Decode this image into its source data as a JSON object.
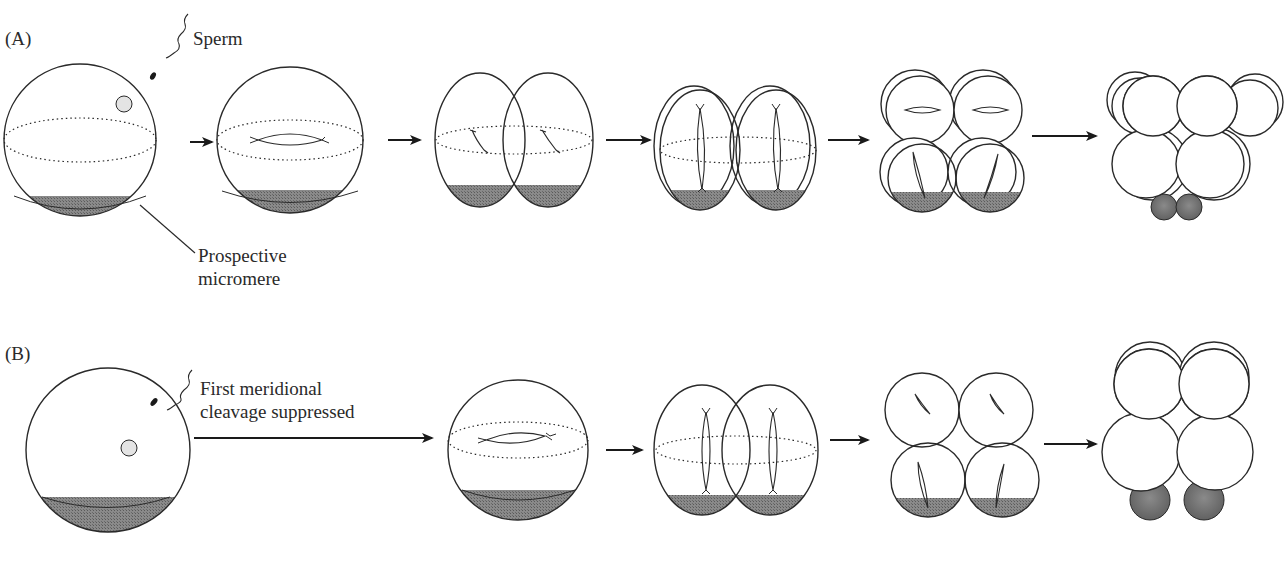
{
  "panels": {
    "a": {
      "label": "(A)",
      "annotations": {
        "sperm": "Sperm",
        "micromere_line1": "Prospective",
        "micromere_line2": "micromere"
      },
      "stages": [
        "fertilized egg",
        "first mitotic spindle",
        "2-cell",
        "4-cell",
        "8-cell",
        "16-cell with micromeres"
      ]
    },
    "b": {
      "label": "(B)",
      "annotations": {
        "cleavage_line1": "First meridional",
        "cleavage_line2": "cleavage suppressed"
      },
      "stages": [
        "fertilized egg",
        "first mitotic spindle",
        "2-cell",
        "4-cell",
        "8-cell with micromeres"
      ]
    }
  },
  "colors": {
    "outline": "#2a2a2a",
    "vegetal_shading": "#7a7a7a",
    "micromere_fill": "#6e6e6e",
    "background": "#ffffff"
  }
}
